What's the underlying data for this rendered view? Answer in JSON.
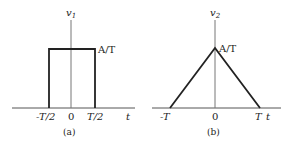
{
  "diagrams": [
    {
      "id": "a",
      "ylabel": "v",
      "ylabel_sub": "1",
      "amplitude_label": "A/T",
      "ticks": [
        "-T/2",
        "0",
        "T/2"
      ],
      "xlabel": "t",
      "caption": "(a)",
      "shape": "rectangle"
    },
    {
      "id": "b",
      "ylabel": "v",
      "ylabel_sub": "2",
      "amplitude_label": "A/T",
      "ticks": [
        "-T",
        "0",
        "T"
      ],
      "xlabel": "t",
      "caption": "(b)",
      "shape": "triangle"
    }
  ],
  "colors": {
    "line": "#222222",
    "axis": "#555555"
  }
}
